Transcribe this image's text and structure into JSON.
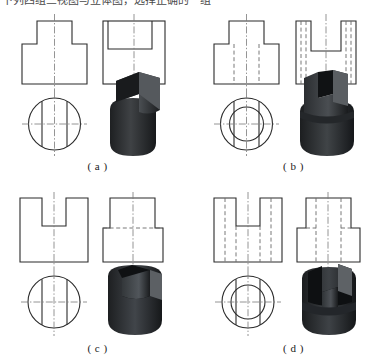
{
  "page": {
    "title_strip": "下列四组三视图与立体图，选择正确的一组",
    "background_color": "#ffffff",
    "line_color": "#2b2b2b",
    "hidden_line_color": "#6a6a6a",
    "center_line_color": "#7a7a7a",
    "solid_color": "#3a3c3e"
  },
  "figure": {
    "type": "engineering-drawing-multiple-choice",
    "layout": "2x2",
    "views_per_option": [
      "front-view",
      "side-view",
      "top-view",
      "isometric-solid"
    ],
    "options": [
      {
        "id": "a",
        "caption": "( a )",
        "front_view": {
          "name": "stepped-T-shape",
          "hidden_lines": false,
          "description": "narrow rectangular boss on top of a wider base, solid outline only"
        },
        "side_view": {
          "name": "rectangle-with-inner-top-rectangle",
          "hidden_lines": false,
          "description": "outer rectangle containing a solid-line inner rectangle at the top"
        },
        "top_view": {
          "name": "circle-with-two-chords",
          "circles": 1,
          "chords": 2,
          "description": "single circle with two vertical chord lines and crossed centerlines"
        },
        "solid": {
          "name": "cylinder-with-rectangular-boss",
          "description": "cylinder topped by a rectangular block boss"
        }
      },
      {
        "id": "b",
        "caption": "( b )",
        "front_view": {
          "name": "stepped-T-shape-with-hidden-lines",
          "hidden_lines": true,
          "description": "T-shaped outline with two dashed vertical hidden lines in the base"
        },
        "side_view": {
          "name": "U-slot-with-hidden-lines",
          "hidden_lines": true,
          "description": "rectangle with U-shaped slot cut from the top and dashed hidden lines running down"
        },
        "top_view": {
          "name": "concentric-circles-with-two-chords",
          "circles": 2,
          "chords": 2,
          "description": "two concentric circles with two vertical chords crossing the inner circle"
        },
        "solid": {
          "name": "cylinder-with-slot-and-collar",
          "description": "cylinder with a deep vertical slot and a stepped collar"
        }
      },
      {
        "id": "c",
        "caption": "( c )",
        "front_view": {
          "name": "U-notch-block",
          "hidden_lines": false,
          "description": "rectangular block with a U-shaped notch cut from the top, solid lines only"
        },
        "side_view": {
          "name": "stepped-rectangle-with-dashed-step",
          "hidden_lines": true,
          "description": "narrow upper rectangle on a wider lower rectangle with a dashed horizontal step line"
        },
        "top_view": {
          "name": "circle-with-two-chords",
          "circles": 1,
          "chords": 2,
          "description": "single circle with two vertical chord lines and crossed centerlines"
        },
        "solid": {
          "name": "cylinder-with-through-slot",
          "description": "cylinder with a wide slot cut down through the top"
        }
      },
      {
        "id": "d",
        "caption": "( d )",
        "front_view": {
          "name": "U-notch-block-with-hidden-lines",
          "hidden_lines": true,
          "description": "U-notched block with dashed vertical hidden lines on both sides"
        },
        "side_view": {
          "name": "stepped-rectangle-with-hidden-lines",
          "hidden_lines": true,
          "description": "narrow top on wider base with dashed vertical hidden lines"
        },
        "top_view": {
          "name": "concentric-circles-with-two-chords",
          "circles": 2,
          "chords": 2,
          "description": "two concentric circles with two vertical chords"
        },
        "solid": {
          "name": "cylinder-with-slot-and-step",
          "description": "stepped cylinder with a vertical slot cut through the upper portion"
        }
      }
    ]
  }
}
